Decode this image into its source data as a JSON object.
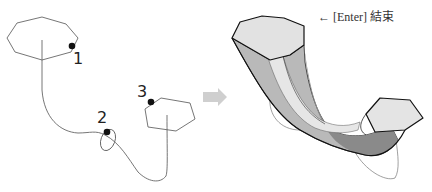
{
  "diagram": {
    "hint": {
      "arrow": "←",
      "key": "[Enter]",
      "action": "結束"
    },
    "points": [
      {
        "label": "1"
      },
      {
        "label": "2"
      },
      {
        "label": "3"
      }
    ],
    "colors": {
      "line": "#555555",
      "point": "#111111",
      "arrow": "#c8c8c8",
      "solid_top": "#e3e3e3",
      "solid_side_light": "#e8e8e8",
      "solid_side_mid": "#b0b0b0",
      "solid_side_dark": "#808080",
      "solid_outline": "#222222"
    }
  }
}
